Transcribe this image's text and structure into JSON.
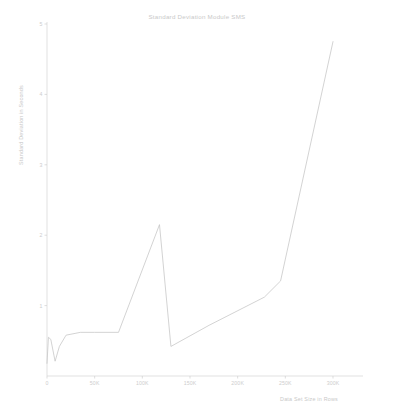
{
  "chart_data": {
    "type": "line",
    "title": "Standard Deviation Module SMS",
    "xlabel": "Data Set Size in Rows",
    "ylabel": "Standard Deviation in Seconds",
    "grid": false,
    "legend": null,
    "xlim": [
      0,
      300000
    ],
    "ylim": [
      0,
      5
    ],
    "xticks": [
      0,
      50000,
      100000,
      150000,
      200000,
      250000,
      300000
    ],
    "xticklabels": [
      "0",
      "50K",
      "100K",
      "150K",
      "200K",
      "250K",
      "300K"
    ],
    "yticks": [
      1,
      2,
      3,
      4,
      5
    ],
    "yticklabels": [
      "1",
      "2",
      "3",
      "4",
      "5"
    ],
    "series": [
      {
        "name": "Standard Deviation",
        "x": [
          0,
          1500,
          4000,
          8500,
          13000,
          20000,
          35000,
          50000,
          75000,
          118000,
          130000,
          170000,
          228000,
          245000,
          300000
        ],
        "y": [
          0.18,
          0.55,
          0.52,
          0.21,
          0.42,
          0.58,
          0.62,
          0.62,
          0.62,
          2.15,
          0.42,
          0.72,
          1.12,
          1.35,
          4.75
        ]
      }
    ]
  },
  "colors": {
    "line": "#c4c4c4",
    "axis": "#d4d4d4",
    "text": "#c9c9c9",
    "background": "#ffffff"
  }
}
